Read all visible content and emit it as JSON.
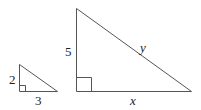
{
  "figure": {
    "small_triangle": {
      "vertical_leg_label": "2",
      "horizontal_leg_label": "3"
    },
    "large_triangle": {
      "vertical_leg_label": "5",
      "horizontal_leg_label": "x",
      "hypotenuse_label": "y"
    },
    "colors": {
      "stroke": "#555555",
      "text": "#222222",
      "background": "#ffffff"
    }
  }
}
